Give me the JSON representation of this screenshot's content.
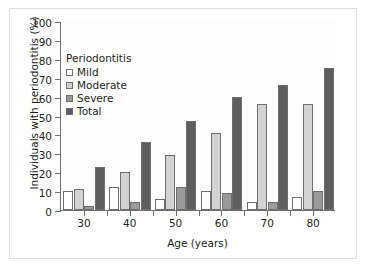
{
  "chart_data": {
    "type": "bar",
    "title": "",
    "xlabel": "Age (years)",
    "ylabel": "Individuals with periodontitis (%)",
    "categories": [
      "30",
      "40",
      "50",
      "60",
      "70",
      "80"
    ],
    "ylim": [
      0,
      100
    ],
    "yticks": [
      "0",
      "10",
      "20",
      "30",
      "40",
      "50",
      "60",
      "70",
      "80",
      "90",
      "100"
    ],
    "grid": false,
    "legend_position": "upper-left-inside",
    "legend_title": "Periodontitis",
    "series": [
      {
        "name": "Mild",
        "color": "#ffffff",
        "values": [
          10,
          12,
          6,
          10,
          4,
          7
        ]
      },
      {
        "name": "Moderate",
        "color": "#d2d2d2",
        "values": [
          11,
          20,
          29,
          41,
          56,
          56
        ]
      },
      {
        "name": "Severe",
        "color": "#9a9a9a",
        "values": [
          2,
          4,
          12,
          9,
          4,
          10
        ]
      },
      {
        "name": "Total",
        "color": "#5e5e5e",
        "values": [
          23,
          36,
          47,
          60,
          66,
          75
        ]
      }
    ]
  }
}
